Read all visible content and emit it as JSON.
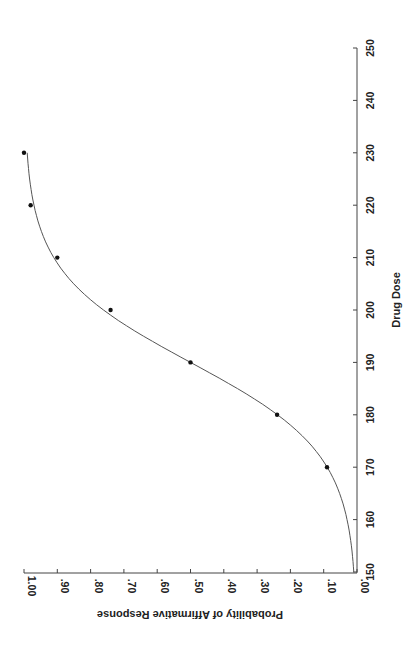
{
  "chart_data": {
    "type": "scatter",
    "title": "",
    "xlabel": "Drug Dose",
    "ylabel": "Probability of Affirmative Response",
    "orientation": "rotated 90° clockwise (dose axis on right, probability axis along bottom)",
    "xlim": [
      150,
      250
    ],
    "ylim": [
      0.0,
      1.0
    ],
    "x_ticks": [
      "150",
      "160",
      "170",
      "180",
      "190",
      "200",
      "210",
      "220",
      "230",
      "240",
      "250"
    ],
    "y_ticks": [
      ".00",
      ".10",
      ".20",
      ".30",
      ".40",
      ".50",
      ".60",
      ".70",
      ".80",
      ".90",
      "1.00"
    ],
    "grid": false,
    "legend": null,
    "series": [
      {
        "name": "Observed",
        "kind": "points",
        "x": [
          170,
          180,
          190,
          200,
          210,
          220,
          230
        ],
        "y": [
          0.09,
          0.24,
          0.5,
          0.74,
          0.9,
          0.98,
          1.0
        ]
      },
      {
        "name": "Fitted logistic curve",
        "kind": "line",
        "model": "p = 1 / (1 + exp(-0.116 * (dose - 190)))",
        "x": [
          150,
          160,
          170,
          180,
          190,
          200,
          210,
          220,
          230
        ],
        "y": [
          0.01,
          0.03,
          0.09,
          0.24,
          0.5,
          0.76,
          0.91,
          0.97,
          0.99
        ]
      }
    ]
  },
  "labels": {
    "x_axis_title": "Drug Dose",
    "y_axis_title": "Probability of Affirmative Response"
  }
}
